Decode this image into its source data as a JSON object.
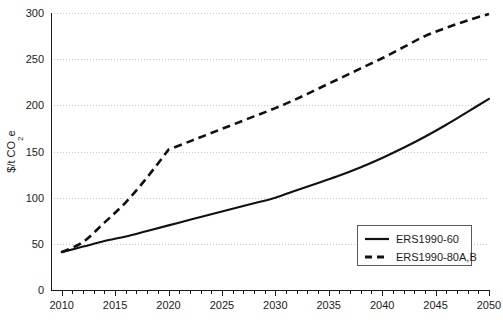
{
  "chart_data": {
    "type": "line",
    "title": "",
    "xlabel": "",
    "ylabel": "$/t CO₂e",
    "ylabel_parts": {
      "pre": "$/t CO",
      "sub": "2",
      "post": "e"
    },
    "xlim": [
      2009,
      2050
    ],
    "ylim": [
      0,
      300
    ],
    "grid": true,
    "legend_position": "bottom-right",
    "x_ticks_major": [
      2010,
      2015,
      2020,
      2025,
      2030,
      2035,
      2040,
      2045,
      2050
    ],
    "x_tick_labels": [
      "2010",
      "2015",
      "2020",
      "2025",
      "2030",
      "2035",
      "2040",
      "2045",
      "2050"
    ],
    "x_minor_tick_step": 1,
    "y_ticks": [
      0,
      50,
      100,
      150,
      200,
      250,
      300
    ],
    "y_tick_labels": [
      "0",
      "50",
      "100",
      "150",
      "200",
      "250",
      "300"
    ],
    "series": [
      {
        "name": "ERS1990-60",
        "style": "solid",
        "color": "#111111",
        "x": [
          2010,
          2012,
          2014,
          2016,
          2018,
          2020,
          2022,
          2024,
          2026,
          2028,
          2030,
          2032,
          2034,
          2036,
          2038,
          2040,
          2042,
          2044,
          2046,
          2048,
          2050
        ],
        "values": [
          41,
          47,
          53,
          58,
          64,
          70,
          76,
          82,
          88,
          94,
          100,
          108,
          116,
          124,
          133,
          143,
          154,
          166,
          179,
          193,
          207
        ]
      },
      {
        "name": "ERS1990-80A,B",
        "style": "dashed",
        "color": "#111111",
        "x": [
          2010,
          2012,
          2014,
          2016,
          2018,
          2020,
          2022,
          2024,
          2026,
          2028,
          2030,
          2032,
          2034,
          2036,
          2038,
          2040,
          2042,
          2044,
          2046,
          2048,
          2050
        ],
        "values": [
          41,
          52,
          73,
          95,
          122,
          152,
          161,
          170,
          179,
          188,
          197,
          207,
          218,
          229,
          240,
          251,
          263,
          275,
          284,
          292,
          299
        ]
      }
    ],
    "legend_entries": [
      {
        "label": "ERS1990-60",
        "style": "solid"
      },
      {
        "label": "ERS1990-80A,B",
        "style": "dashed"
      }
    ]
  }
}
